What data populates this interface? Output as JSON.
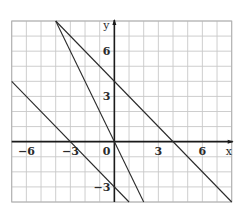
{
  "chart_data": {
    "type": "line",
    "title": "",
    "xlabel": "x",
    "ylabel": "y",
    "xlim": [
      -7,
      8
    ],
    "ylim": [
      -4,
      8
    ],
    "grid": true,
    "grid_step": 1,
    "x_ticks": [
      {
        "value": -6,
        "label": "−6"
      },
      {
        "value": -3,
        "label": "−3"
      },
      {
        "value": 0,
        "label": "0"
      },
      {
        "value": 3,
        "label": "3"
      },
      {
        "value": 6,
        "label": "6"
      }
    ],
    "y_ticks": [
      {
        "value": 6,
        "label": "6"
      },
      {
        "value": 3,
        "label": "3"
      },
      {
        "value": -3,
        "label": "−3"
      }
    ],
    "series": [
      {
        "name": "y = -x + 4",
        "points": [
          [
            -4,
            8
          ],
          [
            8,
            -4
          ]
        ],
        "slope": -1,
        "intercept": 4
      },
      {
        "name": "y = -2x",
        "points": [
          [
            -4,
            8
          ],
          [
            2,
            -4
          ]
        ],
        "slope": -2,
        "intercept": 0
      },
      {
        "name": "y = -x - 3",
        "points": [
          [
            -7,
            4
          ],
          [
            1,
            -4
          ]
        ],
        "slope": -1,
        "intercept": -3
      }
    ],
    "legend": null,
    "colors": {
      "line": "#2a2a2a",
      "grid": "#c8c8c8",
      "axis": "#1a1a1a"
    }
  }
}
